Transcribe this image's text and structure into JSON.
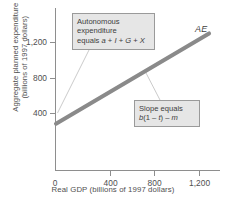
{
  "chart_data": {
    "type": "line",
    "title": "",
    "xlabel": "Real GDP (billions of 1997 dollars)",
    "ylabel_line1": "Aggregate planned expenditure",
    "ylabel_line2": "(billions of 1997 dollars)",
    "xlim": [
      0,
      1500
    ],
    "ylim": [
      0,
      1400
    ],
    "xticks": [
      0,
      400,
      800,
      1200
    ],
    "xticklabels": [
      "0",
      "400",
      "800",
      "1,200"
    ],
    "yticks": [
      400,
      800,
      1200
    ],
    "yticklabels": [
      "400",
      "800",
      "1,200"
    ],
    "grid": false,
    "legend": "none",
    "series": [
      {
        "name": "AE",
        "label": "AE",
        "color": "#8a8a8a",
        "linewidth": 4,
        "x": [
          0,
          1400
        ],
        "y": [
          400,
          1180
        ],
        "intercept": 400,
        "slope": 0.557
      }
    ],
    "annotations": [
      {
        "id": "autonomous-expenditure",
        "lines": [
          "Autonomous",
          "expenditure",
          "equals a + I + G + X"
        ],
        "points_to_x": 0,
        "points_to_y": 400
      },
      {
        "id": "slope",
        "lines": [
          "Slope equals",
          "b(1 – t) – m"
        ],
        "points_to_x": 780,
        "points_to_y": 835
      }
    ]
  },
  "axes": {
    "y_label": {
      "line1": "Aggregate planned expenditure",
      "line2": "(billions of 1997 dollars)"
    },
    "x_label": "Real GDP (billions of 1997 dollars)",
    "y_ticks": [
      {
        "value": 1200,
        "label": "1,200",
        "top": 42
      },
      {
        "value": 800,
        "label": "800",
        "top": 78
      },
      {
        "value": 400,
        "label": "400",
        "top": 113
      }
    ],
    "x_ticks": [
      {
        "value": 400,
        "label": "400",
        "left": 110
      },
      {
        "value": 800,
        "label": "800",
        "left": 154
      },
      {
        "value": 1200,
        "label": "1,200",
        "left": 199
      }
    ],
    "origin_label": "0"
  },
  "series_label": {
    "ae": "AE"
  },
  "callouts": {
    "autonomous": {
      "line1": "Autonomous",
      "line2": "expenditure",
      "line3_prefix": "equals ",
      "line3_a": "a",
      "line3_plus1": " + ",
      "line3_I": "I",
      "line3_plus2": " + ",
      "line3_G": "G",
      "line3_plus3": " + ",
      "line3_X": "X"
    },
    "slope": {
      "line1": "Slope equals",
      "line2_b": "b",
      "line2_open": "(1 – ",
      "line2_t": "t",
      "line2_close": ") – ",
      "line2_m": "m"
    }
  },
  "colors": {
    "axis": "#8e8e8e",
    "ae_line": "#8a8a8a",
    "callout_fill": "#e6e6e6",
    "callout_border": "#9a9a9a",
    "leader_line": "#b0b0b0",
    "text": "#4a4a4a",
    "background": "#ffffff"
  }
}
